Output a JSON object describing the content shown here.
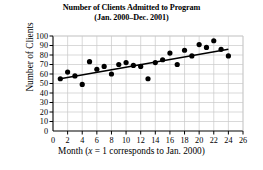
{
  "chart_data": {
    "type": "scatter",
    "title": "Number of Clients Admitted to Program",
    "subtitle": "(Jan. 2000–Dec. 2001)",
    "xlabel": "Month (x = 1 corresponds to Jan. 2000)",
    "xlabel_prefix": "Month (",
    "xlabel_var": "x",
    "xlabel_suffix": " = 1 corresponds to Jan. 2000)",
    "ylabel": "Number of Clients",
    "xlim": [
      0,
      26
    ],
    "ylim": [
      0,
      100
    ],
    "xticks": [
      0,
      2,
      4,
      6,
      8,
      10,
      12,
      14,
      16,
      18,
      20,
      22,
      24,
      26
    ],
    "yticks": [
      0,
      10,
      20,
      30,
      40,
      50,
      60,
      70,
      80,
      90,
      100
    ],
    "grid": true,
    "legend": null,
    "marker_color": "#000000",
    "line_color": "#000000",
    "grid_color": "#c8c8c8",
    "axis_color": "#000000",
    "x": [
      1,
      2,
      3,
      4,
      5,
      6,
      7,
      8,
      9,
      10,
      11,
      12,
      13,
      14,
      15,
      16,
      17,
      18,
      19,
      20,
      21,
      22,
      23,
      24
    ],
    "values": [
      55,
      62,
      58,
      49,
      73,
      65,
      68,
      60,
      70,
      72,
      69,
      68,
      55,
      72,
      75,
      82,
      70,
      85,
      79,
      91,
      88,
      95,
      86,
      79
    ],
    "trendline": {
      "type": "linear-regression",
      "x_start": 1,
      "y_start": 55,
      "x_end": 24,
      "y_end": 86
    }
  }
}
